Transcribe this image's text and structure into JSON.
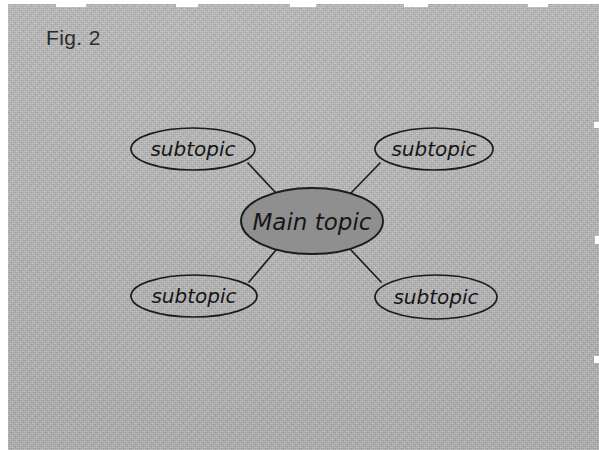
{
  "figure": {
    "caption": "Fig. 2",
    "background_color": "#b7b7b7",
    "ink_color": "#1c1c1c"
  },
  "diagram": {
    "type": "mind-map",
    "center_node": {
      "label": "Main topic",
      "fill_color": "#8f8f8f",
      "cx": 304,
      "cy": 217,
      "rx": 71,
      "ry": 33
    },
    "branches": [
      {
        "label": "subtopic",
        "position": "top-left",
        "cx": 185,
        "cy": 145,
        "rx": 62,
        "ry": 21,
        "line": {
          "x1": 240,
          "y1": 159,
          "x2": 268,
          "y2": 189
        }
      },
      {
        "label": "subtopic",
        "position": "top-right",
        "cx": 426,
        "cy": 145,
        "rx": 59,
        "ry": 21,
        "line": {
          "x1": 372,
          "y1": 159,
          "x2": 342,
          "y2": 190
        }
      },
      {
        "label": "subtopic",
        "position": "bottom-left",
        "cx": 186,
        "cy": 292,
        "rx": 63,
        "ry": 21,
        "line": {
          "x1": 241,
          "y1": 278,
          "x2": 268,
          "y2": 246
        }
      },
      {
        "label": "subtopic",
        "position": "bottom-right",
        "cx": 428,
        "cy": 293,
        "rx": 61,
        "ry": 22,
        "line": {
          "x1": 373,
          "y1": 278,
          "x2": 343,
          "y2": 246
        }
      }
    ]
  }
}
